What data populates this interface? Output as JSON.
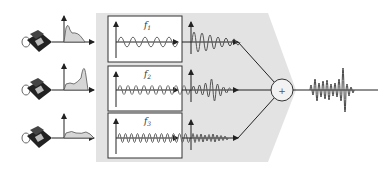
{
  "diagram": {
    "colors": {
      "background": "#ffffff",
      "modulator_region": "#e3e3e3",
      "box_fill": "#ffffff",
      "line": "#222222",
      "spectrum_fill": "#d6d6d6",
      "wave": "#555555"
    },
    "channels": [
      {
        "id": 1,
        "source": "telephone-icon",
        "carrier_label": "f",
        "carrier_sub": "1",
        "carrier_cycles": 5
      },
      {
        "id": 2,
        "source": "telephone-icon",
        "carrier_label": "f",
        "carrier_sub": "2",
        "carrier_cycles": 9
      },
      {
        "id": 3,
        "source": "telephone-icon",
        "carrier_label": "f",
        "carrier_sub": "3",
        "carrier_cycles": 13
      }
    ],
    "summer": {
      "symbol": "+"
    },
    "output": "combined multiplexed signal"
  }
}
